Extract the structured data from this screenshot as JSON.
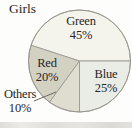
{
  "chart_data": {
    "type": "pie",
    "title": "Girls",
    "categories": [
      "Green",
      "Red",
      "Others",
      "Blue"
    ],
    "values": [
      45,
      20,
      10,
      25
    ],
    "unit": "%",
    "direction": "counterclockwise",
    "start_angle_deg": 0,
    "legend": "none",
    "outline_color": "#96948b",
    "leader_line_color": "#6b6b64",
    "text_color": "#26261f",
    "slices": [
      {
        "label": "Green",
        "value": 45,
        "pct": "45%",
        "color": "#f5f4ec",
        "label_placement": "inside"
      },
      {
        "label": "Red",
        "value": 20,
        "pct": "20%",
        "color": "#d3d1c2",
        "label_placement": "inside"
      },
      {
        "label": "Others",
        "value": 10,
        "pct": "10%",
        "color": "#dfddcf",
        "label_placement": "outside-with-leader"
      },
      {
        "label": "Blue",
        "value": 25,
        "pct": "25%",
        "color": "#eaece6",
        "label_placement": "inside"
      }
    ]
  }
}
